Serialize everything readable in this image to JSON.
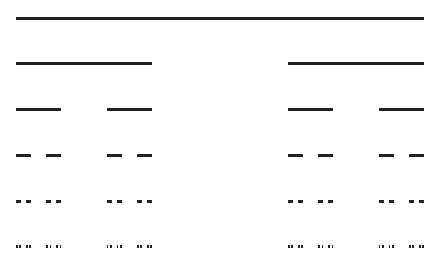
{
  "diagram": {
    "title": "",
    "type": "cantor-set-construction",
    "x_start": 16,
    "x_end": 424,
    "stroke_color": "#222222",
    "stroke_width": 3,
    "iterations": 6,
    "rows_y": [
      18,
      63,
      109,
      155,
      201,
      246
    ]
  }
}
